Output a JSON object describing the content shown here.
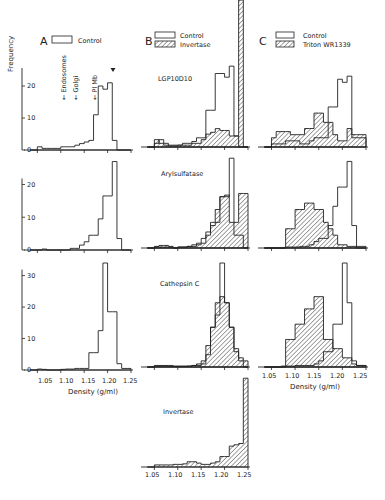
{
  "figure": {
    "panels": {
      "A": "A",
      "B": "B",
      "C": "C"
    },
    "ylabel": "Frequency",
    "xlabel": "Density (g/ml)",
    "legends": {
      "A": [
        {
          "label": "Control",
          "style": "open"
        }
      ],
      "B": [
        {
          "label": "Control",
          "style": "open"
        },
        {
          "label": "Invertase",
          "style": "hatched"
        }
      ],
      "C": [
        {
          "label": "Control",
          "style": "open"
        },
        {
          "label": "Triton WR1339",
          "style": "hatched"
        }
      ]
    },
    "markers": [
      {
        "label": "Endosomes",
        "x": 1.087
      },
      {
        "label": "Golgi",
        "x": 1.108
      },
      {
        "label": "Pl Mb",
        "x": 1.138
      }
    ],
    "row_titles": [
      "LGP10D10",
      "Arylsulfatase",
      "Cathepsin C",
      "Invertase"
    ],
    "x_ticks": [
      "1.05",
      "1.10",
      "1.15",
      "1.20",
      "1.25"
    ],
    "colors": {
      "ink": "#222222",
      "background": "#ffffff"
    }
  },
  "chart_data": [
    {
      "type": "bar",
      "panel": "A",
      "row": "LGP10D10",
      "x_edges": [
        1.035,
        1.05,
        1.06,
        1.07,
        1.08,
        1.09,
        1.1,
        1.11,
        1.12,
        1.13,
        1.14,
        1.15,
        1.16,
        1.17,
        1.18,
        1.19,
        1.2,
        1.21,
        1.22,
        1.23,
        1.25
      ],
      "series": [
        {
          "name": "Control",
          "values": [
            0,
            1,
            0.5,
            0.5,
            0.5,
            0.5,
            1,
            1,
            1,
            1.5,
            2,
            2.5,
            3,
            11,
            20,
            19,
            21,
            3,
            0,
            0
          ]
        }
      ],
      "y_ticks": [
        0,
        10,
        20
      ],
      "ylim": [
        0,
        25
      ],
      "xlim": [
        1.03,
        1.25
      ],
      "annotation": "arrow at 1.20"
    },
    {
      "type": "bar",
      "panel": "A",
      "row": "Arylsulfatase",
      "x_edges": [
        1.035,
        1.05,
        1.06,
        1.07,
        1.08,
        1.09,
        1.1,
        1.11,
        1.12,
        1.13,
        1.14,
        1.15,
        1.16,
        1.17,
        1.18,
        1.19,
        1.2,
        1.21,
        1.22,
        1.23,
        1.25
      ],
      "series": [
        {
          "name": "Control",
          "values": [
            0,
            0,
            0.3,
            0,
            0,
            0,
            0,
            0,
            0.5,
            0.5,
            1.5,
            2.5,
            4.5,
            4.5,
            9.5,
            16.5,
            16.5,
            27,
            3.5,
            0
          ]
        }
      ],
      "y_ticks": [
        0,
        10,
        20
      ],
      "ylim": [
        0,
        29
      ],
      "xlim": [
        1.03,
        1.25
      ]
    },
    {
      "type": "bar",
      "panel": "A",
      "row": "Cathepsin C",
      "x_edges": [
        1.035,
        1.05,
        1.06,
        1.07,
        1.08,
        1.09,
        1.1,
        1.11,
        1.12,
        1.13,
        1.14,
        1.15,
        1.16,
        1.17,
        1.18,
        1.19,
        1.2,
        1.21,
        1.22,
        1.23,
        1.25
      ],
      "series": [
        {
          "name": "Control",
          "values": [
            0,
            0.3,
            0.2,
            0,
            0,
            0,
            0.2,
            0.3,
            0.3,
            0.5,
            0.5,
            0.5,
            5.5,
            5.5,
            12.5,
            34,
            18.5,
            18.5,
            2,
            0.5
          ]
        }
      ],
      "y_ticks": [
        0,
        10,
        20,
        30
      ],
      "ylim": [
        0,
        34
      ],
      "xlim": [
        1.03,
        1.25
      ]
    },
    {
      "type": "bar",
      "panel": "B",
      "row": "LGP10D10",
      "x_edges": [
        1.035,
        1.05,
        1.06,
        1.07,
        1.08,
        1.09,
        1.1,
        1.11,
        1.12,
        1.13,
        1.14,
        1.15,
        1.16,
        1.17,
        1.18,
        1.19,
        1.2,
        1.21,
        1.22,
        1.23,
        1.24,
        1.25
      ],
      "series": [
        {
          "name": "Control",
          "values": [
            0,
            1,
            2,
            1,
            0.5,
            0.5,
            0.5,
            1,
            1,
            1.5,
            2.5,
            2.5,
            10,
            10,
            20,
            20,
            19,
            22,
            3,
            0,
            0
          ]
        },
        {
          "name": "Invertase",
          "values": [
            0,
            2,
            1,
            0.5,
            0.3,
            0.3,
            0.5,
            0.5,
            0.5,
            1,
            1,
            2,
            3.5,
            4,
            5,
            4.5,
            4.5,
            3,
            3,
            40,
            0
          ]
        }
      ],
      "y_ticks": [],
      "ylim": [
        0,
        40
      ],
      "xlim": [
        1.03,
        1.25
      ]
    },
    {
      "type": "bar",
      "panel": "B",
      "row": "Arylsulfatase",
      "x_edges": [
        1.035,
        1.05,
        1.06,
        1.07,
        1.08,
        1.09,
        1.1,
        1.11,
        1.12,
        1.13,
        1.14,
        1.15,
        1.16,
        1.17,
        1.18,
        1.19,
        1.2,
        1.21,
        1.22,
        1.23,
        1.24,
        1.25
      ],
      "series": [
        {
          "name": "Control",
          "values": [
            0,
            0.3,
            0.3,
            0.3,
            0.3,
            0,
            0.3,
            0.3,
            0.5,
            1,
            1.5,
            3,
            5,
            8,
            8,
            16,
            16,
            28,
            4,
            4,
            0
          ]
        },
        {
          "name": "Invertase",
          "values": [
            0,
            0.5,
            0.8,
            0.8,
            0.5,
            0,
            0.3,
            0.3,
            0.5,
            0.5,
            1,
            1.5,
            4,
            7,
            12,
            16,
            16.5,
            8,
            8,
            17,
            17
          ]
        }
      ],
      "y_ticks": [],
      "ylim": [
        0,
        29
      ],
      "xlim": [
        1.03,
        1.25
      ]
    },
    {
      "type": "bar",
      "panel": "B",
      "row": "Cathepsin C",
      "x_edges": [
        1.035,
        1.05,
        1.06,
        1.07,
        1.08,
        1.09,
        1.1,
        1.11,
        1.12,
        1.13,
        1.14,
        1.15,
        1.16,
        1.17,
        1.18,
        1.19,
        1.2,
        1.21,
        1.22,
        1.23,
        1.24,
        1.25
      ],
      "series": [
        {
          "name": "Control",
          "values": [
            0,
            0.3,
            0.3,
            0.3,
            0.2,
            0.2,
            0.2,
            0.2,
            0.3,
            0.5,
            0.5,
            1,
            4,
            13,
            17,
            34,
            21,
            13,
            5,
            2,
            0
          ]
        },
        {
          "name": "Invertase",
          "values": [
            0,
            0.5,
            0.5,
            0.5,
            0.5,
            0.3,
            0.3,
            0.3,
            0.3,
            0.5,
            1,
            2,
            7,
            13,
            21,
            23,
            21,
            13,
            6,
            3,
            2
          ]
        }
      ],
      "y_ticks": [],
      "ylim": [
        0,
        34
      ],
      "xlim": [
        1.03,
        1.25
      ]
    },
    {
      "type": "bar",
      "panel": "B",
      "row": "Invertase",
      "x_edges": [
        1.035,
        1.05,
        1.06,
        1.07,
        1.08,
        1.09,
        1.1,
        1.11,
        1.12,
        1.13,
        1.14,
        1.15,
        1.16,
        1.17,
        1.18,
        1.19,
        1.2,
        1.21,
        1.22,
        1.23,
        1.24,
        1.25
      ],
      "series": [
        {
          "name": "Invertase",
          "values": [
            0,
            0.8,
            0.8,
            0.8,
            0.8,
            1,
            1,
            1.2,
            2,
            2,
            1.5,
            1,
            1,
            1.5,
            2,
            4,
            4,
            8,
            8.5,
            9,
            34
          ]
        }
      ],
      "y_ticks": [],
      "ylim": [
        0,
        36
      ],
      "xlim": [
        1.03,
        1.25
      ]
    },
    {
      "type": "bar",
      "panel": "C",
      "row": "LGP10D10",
      "x_edges": [
        1.035,
        1.05,
        1.06,
        1.07,
        1.08,
        1.09,
        1.1,
        1.11,
        1.12,
        1.13,
        1.14,
        1.15,
        1.16,
        1.17,
        1.18,
        1.19,
        1.2,
        1.21,
        1.22,
        1.23,
        1.25
      ],
      "series": [
        {
          "name": "Control",
          "values": [
            0,
            1,
            1,
            1,
            2,
            2,
            2,
            1,
            1,
            2,
            3,
            3,
            3,
            13,
            13,
            22,
            21,
            23,
            3,
            3
          ]
        },
        {
          "name": "Triton WR1339",
          "values": [
            0,
            3,
            5,
            5,
            5,
            4,
            4,
            4,
            6,
            6,
            11,
            11,
            8,
            8,
            4,
            2,
            2,
            6,
            4,
            4
          ]
        }
      ],
      "y_ticks": [],
      "ylim": [
        0,
        25
      ],
      "xlim": [
        1.03,
        1.25
      ]
    },
    {
      "type": "bar",
      "panel": "C",
      "row": "Arylsulfatase",
      "x_edges": [
        1.035,
        1.05,
        1.06,
        1.07,
        1.08,
        1.09,
        1.1,
        1.11,
        1.12,
        1.13,
        1.14,
        1.15,
        1.16,
        1.17,
        1.18,
        1.19,
        1.2,
        1.21,
        1.22,
        1.23,
        1.25
      ],
      "series": [
        {
          "name": "Control",
          "values": [
            0,
            0,
            0,
            0,
            0.3,
            0.3,
            0.3,
            0.5,
            0.5,
            1,
            2,
            3,
            3,
            7,
            13,
            19,
            19,
            27,
            7,
            0.5
          ]
        },
        {
          "name": "Triton WR1339",
          "values": [
            0,
            0,
            0,
            0,
            6,
            6,
            12,
            12,
            14,
            14,
            12,
            12,
            8,
            6,
            4,
            1,
            1,
            0.5,
            0.5,
            0
          ]
        }
      ],
      "y_ticks": [],
      "ylim": [
        0,
        29
      ],
      "xlim": [
        1.03,
        1.25
      ]
    },
    {
      "type": "bar",
      "panel": "C",
      "row": "Cathepsin C",
      "x_edges": [
        1.035,
        1.05,
        1.06,
        1.07,
        1.08,
        1.09,
        1.1,
        1.11,
        1.12,
        1.13,
        1.14,
        1.15,
        1.16,
        1.17,
        1.18,
        1.19,
        1.2,
        1.21,
        1.22,
        1.23,
        1.25
      ],
      "series": [
        {
          "name": "Control",
          "values": [
            0,
            0,
            0,
            0.3,
            0.3,
            0.3,
            0.5,
            0.5,
            0.5,
            0.5,
            1,
            2,
            5,
            5,
            14,
            14,
            34,
            21,
            2,
            0.5
          ]
        },
        {
          "name": "Triton WR1339",
          "values": [
            0,
            0,
            0,
            0,
            9,
            9,
            14,
            14,
            19,
            19,
            23,
            23,
            9,
            9,
            6,
            6,
            3,
            3,
            1,
            0.5
          ]
        }
      ],
      "y_ticks": [],
      "ylim": [
        0,
        34
      ],
      "xlim": [
        1.03,
        1.25
      ]
    }
  ]
}
